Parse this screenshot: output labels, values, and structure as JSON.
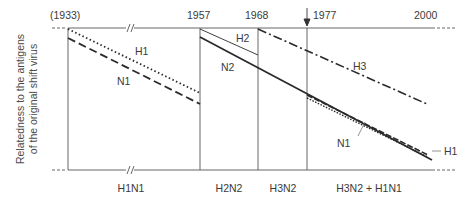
{
  "diagram": {
    "y_axis_label_line1": "Relatedness to the antigens",
    "y_axis_label_line2": "of the original shift virus",
    "years": [
      {
        "label": "(1933)"
      },
      {
        "label": "1957"
      },
      {
        "label": "1968"
      },
      {
        "label": "1977"
      },
      {
        "label": "2000"
      }
    ],
    "subtypes": [
      {
        "label": "H1N1"
      },
      {
        "label": "H2N2"
      },
      {
        "label": "H3N2"
      },
      {
        "label": "H3N2 + H1N1"
      }
    ],
    "lines": {
      "h1_first": {
        "label": "H1",
        "style": "dotted"
      },
      "n1_first": {
        "label": "N1",
        "style": "dashed"
      },
      "h2": {
        "label": "H2",
        "style": "thin-solid"
      },
      "n2": {
        "label": "N2",
        "style": "thick-solid"
      },
      "h3": {
        "label": "H3",
        "style": "dash-dot"
      },
      "n1_return": {
        "label": "N1",
        "style": "dashed"
      },
      "h1_return": {
        "label": "H1",
        "style": "dotted"
      }
    },
    "colors": {
      "line": "#2a2a2a",
      "axis": "#555555",
      "text": "#3a3a3a"
    }
  }
}
